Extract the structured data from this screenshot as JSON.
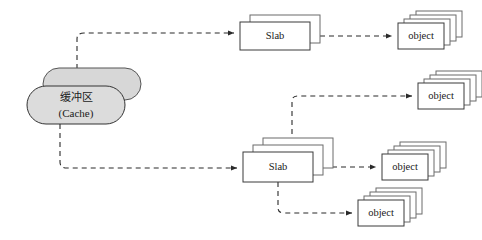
{
  "diagram": {
    "background_color": "#ffffff",
    "line_color": "#2a2a2a",
    "line_style": "dashed",
    "cache": {
      "name": "cache-node",
      "label_cn": "缓冲区",
      "label_en": "(Cache)",
      "fill_color": "#dcdcdc",
      "stroke_color": "#333333",
      "shape": "stacked-rounded-rectangle",
      "layers": 2
    },
    "slabs": [
      {
        "name": "slab-node-1",
        "label": "Slab",
        "layers": 2,
        "fill_color": "#ffffff",
        "stroke_color": "#3a3a3a"
      },
      {
        "name": "slab-node-2",
        "label": "Slab",
        "layers": 3,
        "fill_color": "#ffffff",
        "stroke_color": "#3a3a3a"
      }
    ],
    "objects": [
      {
        "name": "object-node-1",
        "label": "object",
        "layers": 4,
        "fill_color": "#ffffff",
        "stroke_color": "#3a3a3a"
      },
      {
        "name": "object-node-2",
        "label": "object",
        "layers": 4,
        "fill_color": "#ffffff",
        "stroke_color": "#3a3a3a"
      },
      {
        "name": "object-node-3",
        "label": "object",
        "layers": 4,
        "fill_color": "#ffffff",
        "stroke_color": "#3a3a3a"
      },
      {
        "name": "object-node-4",
        "label": "object",
        "layers": 4,
        "fill_color": "#ffffff",
        "stroke_color": "#3a3a3a"
      }
    ],
    "connectors": [
      {
        "name": "connector-cache-to-slab-1",
        "from": "cache-node",
        "to": "slab-node-1",
        "arrow": true
      },
      {
        "name": "connector-cache-to-slab-2",
        "from": "cache-node",
        "to": "slab-node-2",
        "arrow": true
      },
      {
        "name": "connector-slab-1-to-object-1",
        "from": "slab-node-1",
        "to": "object-node-1",
        "arrow": true
      },
      {
        "name": "connector-slab-2-to-object-2",
        "from": "slab-node-2",
        "to": "object-node-2",
        "arrow": true
      },
      {
        "name": "connector-slab-2-to-object-3",
        "from": "slab-node-2",
        "to": "object-node-3",
        "arrow": true
      },
      {
        "name": "connector-slab-2-to-object-4",
        "from": "slab-node-2",
        "to": "object-node-4",
        "arrow": true
      }
    ]
  }
}
